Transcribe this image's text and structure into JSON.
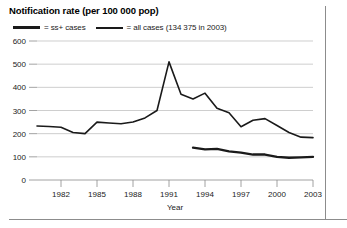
{
  "chart_data": {
    "type": "line",
    "title": "Notification rate (per 100 000 pop)",
    "xlabel": "Year",
    "ylabel": "",
    "xlim": [
      1980,
      2003
    ],
    "ylim": [
      0,
      600
    ],
    "grid": true,
    "legend_position": "top-left",
    "y_ticks": [
      "0",
      "100",
      "200",
      "300",
      "400",
      "500",
      "600"
    ],
    "y_tick_values": [
      0,
      100,
      200,
      300,
      400,
      500,
      600
    ],
    "x_ticks": [
      "1982",
      "1985",
      "1988",
      "1991",
      "1994",
      "1997",
      "2000",
      "2003"
    ],
    "x_tick_values": [
      1982,
      1985,
      1988,
      1991,
      1994,
      1997,
      2000,
      2003
    ],
    "series": [
      {
        "name": "ss+ cases",
        "legend_label": "= ss+ cases",
        "style": "thick",
        "color": "#1a1a1a",
        "x": [
          1993,
          1994,
          1995,
          1996,
          1997,
          1998,
          1999,
          2000,
          2001,
          2002,
          2003
        ],
        "values": [
          140,
          132,
          134,
          124,
          118,
          110,
          110,
          100,
          96,
          98,
          100
        ]
      },
      {
        "name": "all cases",
        "legend_label": "= all cases (134 375 in 2003)",
        "style": "thin",
        "color": "#1a1a1a",
        "x": [
          1980,
          1981,
          1982,
          1983,
          1984,
          1985,
          1986,
          1987,
          1988,
          1989,
          1990,
          1991,
          1992,
          1993,
          1994,
          1995,
          1996,
          1997,
          1998,
          1999,
          2000,
          2001,
          2002,
          2003
        ],
        "values": [
          233,
          231,
          228,
          205,
          200,
          250,
          246,
          243,
          250,
          268,
          300,
          510,
          370,
          350,
          375,
          310,
          290,
          230,
          258,
          265,
          235,
          205,
          185,
          183
        ]
      }
    ],
    "annotations": []
  },
  "legend": {
    "entries": [
      {
        "label": "= ss+ cases"
      },
      {
        "label": "= all cases (134 375 in 2003)"
      }
    ]
  },
  "axis": {
    "x_title": "Year"
  }
}
